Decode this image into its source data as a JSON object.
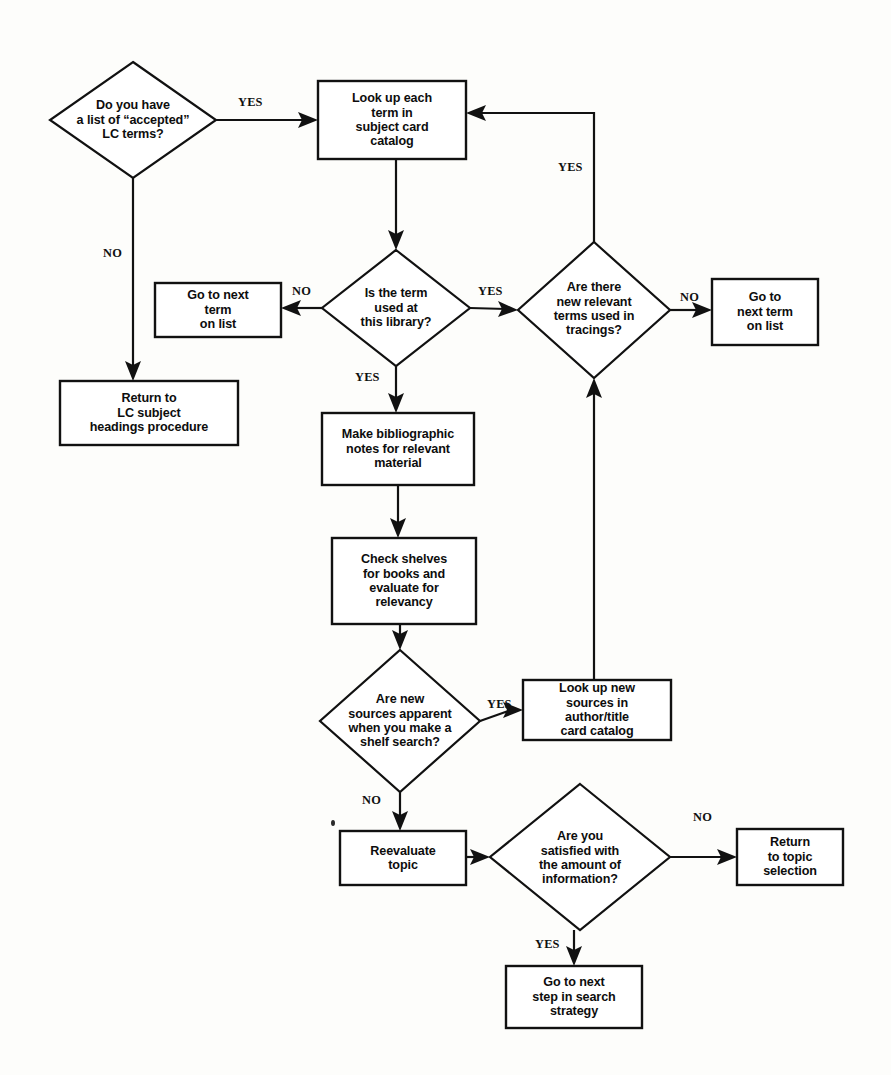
{
  "diagram": {
    "background_color": "#fdfdfb",
    "line_color": "#111111",
    "text_color": "#0d0d0d"
  },
  "nodes": [
    {
      "id": "have-list",
      "type": "decision",
      "text": "Do you have\na list of “accepted”\nLC terms?",
      "x": 50,
      "y": 62,
      "w": 166,
      "h": 116
    },
    {
      "id": "look-up-each-term",
      "type": "process",
      "text": "Look up each\nterm in\nsubject card\ncatalog",
      "x": 318,
      "y": 81,
      "w": 148,
      "h": 78
    },
    {
      "id": "return-lc-subject",
      "type": "process",
      "text": "Return to\nLC subject\nheadings procedure",
      "x": 60,
      "y": 381,
      "w": 178,
      "h": 64
    },
    {
      "id": "go-next-term-left",
      "type": "process",
      "text": "Go to next\nterm\non list",
      "x": 155,
      "y": 283,
      "w": 126,
      "h": 54
    },
    {
      "id": "term-used",
      "type": "decision",
      "text": "Is the term\nused at\nthis library?",
      "x": 322,
      "y": 250,
      "w": 148,
      "h": 116
    },
    {
      "id": "new-relevant-terms",
      "type": "decision",
      "text": "Are there\nnew relevant\nterms used in\ntracings?",
      "x": 518,
      "y": 242,
      "w": 152,
      "h": 136
    },
    {
      "id": "go-next-term-right",
      "type": "process",
      "text": "Go to\nnext term\non list",
      "x": 712,
      "y": 279,
      "w": 106,
      "h": 66
    },
    {
      "id": "make-notes",
      "type": "process",
      "text": "Make bibliographic\nnotes for relevant\nmaterial",
      "x": 322,
      "y": 413,
      "w": 152,
      "h": 72
    },
    {
      "id": "check-shelves",
      "type": "process",
      "text": "Check shelves\nfor books and\nevaluate for\nrelevancy",
      "x": 332,
      "y": 538,
      "w": 144,
      "h": 86
    },
    {
      "id": "new-sources",
      "type": "decision",
      "text": "Are new\nsources apparent\nwhen you make a\nshelf search?",
      "x": 320,
      "y": 650,
      "w": 160,
      "h": 142
    },
    {
      "id": "look-up-new-sources",
      "type": "process",
      "text": "Look up new\nsources in\nauthor/title\ncard catalog",
      "x": 523,
      "y": 680,
      "w": 148,
      "h": 60
    },
    {
      "id": "reevaluate-topic",
      "type": "process",
      "text": "Reevaluate\ntopic",
      "x": 340,
      "y": 831,
      "w": 126,
      "h": 54
    },
    {
      "id": "satisfied",
      "type": "decision",
      "text": "Are you\nsatisfied with\nthe amount of\ninformation?",
      "x": 490,
      "y": 784,
      "w": 180,
      "h": 146
    },
    {
      "id": "return-topic-selection",
      "type": "process",
      "text": "Return\nto topic\nselection",
      "x": 737,
      "y": 829,
      "w": 106,
      "h": 56
    },
    {
      "id": "go-next-step",
      "type": "process",
      "text": "Go to next\nstep in search\nstrategy",
      "x": 506,
      "y": 966,
      "w": 136,
      "h": 62
    }
  ],
  "edges": [
    {
      "id": "have-list-yes",
      "from": "have-list",
      "to": "look-up-each-term",
      "label": "YES",
      "label_x": 238,
      "label_y": 95
    },
    {
      "id": "have-list-no",
      "from": "have-list",
      "to": "return-lc-subject",
      "label": "NO",
      "label_x": 103,
      "label_y": 246
    },
    {
      "id": "look-up-to-term-used",
      "from": "look-up-each-term",
      "to": "term-used",
      "label": ""
    },
    {
      "id": "term-used-no",
      "from": "term-used",
      "to": "go-next-term-left",
      "label": "NO",
      "label_x": 292,
      "label_y": 284
    },
    {
      "id": "term-used-yes-right",
      "from": "term-used",
      "to": "new-relevant-terms",
      "label": "YES",
      "label_x": 478,
      "label_y": 284
    },
    {
      "id": "term-used-yes-down",
      "from": "term-used",
      "to": "make-notes",
      "label": "YES",
      "label_x": 355,
      "label_y": 370
    },
    {
      "id": "new-terms-yes",
      "from": "new-relevant-terms",
      "to": "look-up-each-term",
      "label": "YES",
      "label_x": 558,
      "label_y": 160
    },
    {
      "id": "new-terms-no",
      "from": "new-relevant-terms",
      "to": "go-next-term-right",
      "label": "NO",
      "label_x": 680,
      "label_y": 290
    },
    {
      "id": "make-notes-to-shelves",
      "from": "make-notes",
      "to": "check-shelves",
      "label": ""
    },
    {
      "id": "shelves-to-new-sources",
      "from": "check-shelves",
      "to": "new-sources",
      "label": ""
    },
    {
      "id": "new-sources-yes",
      "from": "new-sources",
      "to": "look-up-new-sources",
      "label": "YES",
      "label_x": 487,
      "label_y": 697
    },
    {
      "id": "new-sources-no",
      "from": "new-sources",
      "to": "reevaluate-topic",
      "label": "NO",
      "label_x": 362,
      "label_y": 793
    },
    {
      "id": "look-up-new-to-new-terms",
      "from": "look-up-new-sources",
      "to": "new-relevant-terms",
      "label": ""
    },
    {
      "id": "reevaluate-to-satisfied",
      "from": "reevaluate-topic",
      "to": "satisfied",
      "label": ""
    },
    {
      "id": "satisfied-no",
      "from": "satisfied",
      "to": "return-topic-selection",
      "label": "NO",
      "label_x": 693,
      "label_y": 810
    },
    {
      "id": "satisfied-yes",
      "from": "satisfied",
      "to": "go-next-step",
      "label": "YES",
      "label_x": 535,
      "label_y": 937
    }
  ],
  "artifacts": [
    {
      "id": "speck-1",
      "x": 331,
      "y": 820,
      "w": 4,
      "h": 6
    }
  ]
}
